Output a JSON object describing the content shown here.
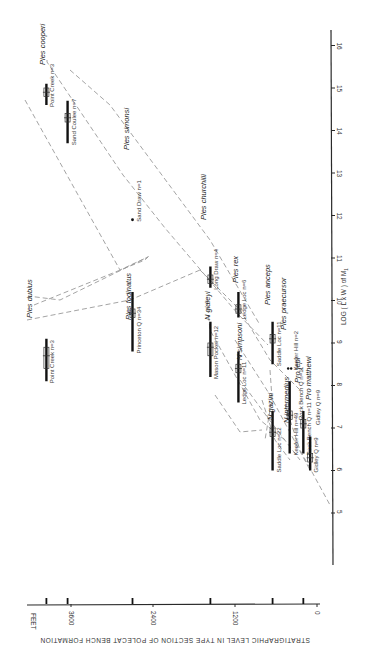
{
  "chart_data": {
    "type": "scatter",
    "orientation": "rotated-90-clockwise",
    "title": "",
    "xlabel": "LOG ( L x W ) of M1",
    "ylabel": "STRATIGRAPHIC LEVEL IN TYPE SECTION OF POLECAT BENCH FORMATION",
    "y_unit_label": "FEET",
    "x_ticks": [
      "5",
      "6",
      "7",
      "8",
      "9",
      "1.0",
      "1.1",
      "1.2",
      "1.3",
      "1.4",
      "1.5",
      "1.6"
    ],
    "x_tick_values": [
      0.5,
      0.6,
      0.7,
      0.8,
      0.9,
      1.0,
      1.1,
      1.2,
      1.3,
      1.4,
      1.5,
      1.6
    ],
    "y_ticks": [
      "0",
      "1200",
      "2400",
      "3600"
    ],
    "y_tick_values": [
      0,
      1200,
      2400,
      3600
    ],
    "xlim": [
      0.45,
      1.65
    ],
    "ylim": [
      0,
      4000
    ],
    "grid": false,
    "locality_levels_ft": [
      3960,
      3650,
      2700,
      1560,
      650,
      200
    ],
    "samples": [
      {
        "locality": "Point Creek",
        "n": "n=3",
        "level_ft": 3960,
        "min": 1.46,
        "max": 1.51,
        "mean": 1.49,
        "box": [
          1.48,
          1.5
        ]
      },
      {
        "locality": "Sand Coulee",
        "n": "n=7",
        "level_ft": 3650,
        "min": 1.37,
        "max": 1.47,
        "mean": 1.43,
        "box": [
          1.42,
          1.44
        ]
      },
      {
        "locality": "Point Creek",
        "n": "n=3",
        "level_ft": 3960,
        "min": 0.81,
        "max": 0.91,
        "mean": 0.87,
        "box": [
          0.84,
          0.89
        ]
      },
      {
        "locality": "Sand Draw",
        "n": "n=1",
        "level_ft": 2700,
        "min": 1.19,
        "max": 1.19,
        "mean": 1.19,
        "single": true
      },
      {
        "locality": "Princeton Q",
        "n": "n=34",
        "level_ft": 2700,
        "min": 0.88,
        "max": 1.02,
        "mean": 0.97,
        "box": [
          0.96,
          0.98
        ]
      },
      {
        "locality": "Long Draw",
        "n": "n=4",
        "level_ft": 1560,
        "min": 1.03,
        "max": 1.08,
        "mean": 1.05,
        "box": [
          1.04,
          1.06
        ]
      },
      {
        "locality": "Mason Pocket",
        "n": "n=12",
        "level_ft": 1560,
        "min": 0.82,
        "max": 0.95,
        "mean": 0.89,
        "box": [
          0.87,
          0.9
        ]
      },
      {
        "locality": "Ledge Loc",
        "n": "n=6",
        "level_ft": 1150,
        "min": 0.96,
        "max": 1.02,
        "mean": 0.98,
        "box": [
          0.97,
          0.99
        ]
      },
      {
        "locality": "Ledge Loc",
        "n": "n=11",
        "level_ft": 1150,
        "min": 0.76,
        "max": 0.88,
        "mean": 0.84,
        "box": [
          0.83,
          0.85
        ]
      },
      {
        "locality": "Saddle Loc",
        "n": "n=11",
        "level_ft": 650,
        "min": 0.85,
        "max": 0.95,
        "mean": 0.91,
        "box": [
          0.9,
          0.92
        ]
      },
      {
        "locality": "Saddle Loc",
        "n": "n=22",
        "level_ft": 650,
        "min": 0.6,
        "max": 0.74,
        "mean": 0.69,
        "box": [
          0.68,
          0.7
        ]
      },
      {
        "locality": "Keefer Hill",
        "n": "n=2",
        "level_ft": 400,
        "min": 0.84,
        "max": 0.84,
        "mean": 0.84,
        "double": true
      },
      {
        "locality": "Keefer Hill",
        "n": "n=49",
        "level_ft": 400,
        "min": 0.64,
        "max": 0.81,
        "mean": 0.73,
        "box": [
          0.72,
          0.74
        ]
      },
      {
        "locality": "Rock Bench Q",
        "n": "n=11",
        "level_ft": 200,
        "min": 0.64,
        "max": 0.74,
        "mean": 0.71,
        "box": [
          0.7,
          0.72
        ]
      },
      {
        "locality": "Gidley Q",
        "n": "n=9",
        "level_ft": 100,
        "min": 0.6,
        "max": 0.68,
        "mean": 0.63,
        "box": [
          0.62,
          0.64
        ]
      }
    ],
    "species_labels": [
      {
        "name": "Ples cooperi",
        "x": 1.56,
        "level_ft": 4050
      },
      {
        "name": "Ples simonsi",
        "x": 1.27,
        "level_ft": 3200
      },
      {
        "name": "Ples churchilli",
        "x": 1.12,
        "level_ft": 2250
      },
      {
        "name": "Ples rex",
        "x": 1.03,
        "level_ft": 1550
      },
      {
        "name": "Ples anceps",
        "x": 0.96,
        "level_ft": 500
      },
      {
        "name": "Ples praecursor",
        "x": 0.94,
        "level_ft": 300
      },
      {
        "name": "Pro jepi",
        "x": 0.83,
        "level_ft": 100
      },
      {
        "name": "Pro matthewi",
        "x": 0.78,
        "level_ft": 50
      },
      {
        "name": "Ples dubius",
        "x": 0.73,
        "level_ft": 4200
      },
      {
        "name": "Ples fodinatus",
        "x": 0.74,
        "level_ft": 2900
      },
      {
        "name": "N gidleyi",
        "x": 0.74,
        "level_ft": 1750
      },
      {
        "name": "N simpsoni",
        "x": 0.64,
        "level_ft": 1300
      },
      {
        "name": "N gazini",
        "x": 0.54,
        "level_ft": 800
      },
      {
        "name": "N intermedius",
        "x": 0.52,
        "level_ft": 550
      },
      {
        "name": "Rock Bench Q n=11",
        "x": 0.5,
        "level_ft": 350
      },
      {
        "name": "Gidley Q n=9",
        "x": 0.47,
        "level_ft": 150
      }
    ]
  },
  "axes": {
    "feet_label": "FEET",
    "feet_ticks": [
      "3600",
      "2400",
      "1200",
      "0"
    ],
    "log_label": "LOG ( L x W ) of M",
    "log_subscript": "1",
    "log_ticks": [
      "16",
      "15",
      "14",
      "13",
      "12",
      "11",
      "10",
      "9",
      "8",
      "7",
      "6",
      "5"
    ],
    "bottom_title": "STRATIGRAPHIC LEVEL IN TYPE SECTION OF POLECAT BENCH FORMATION"
  }
}
